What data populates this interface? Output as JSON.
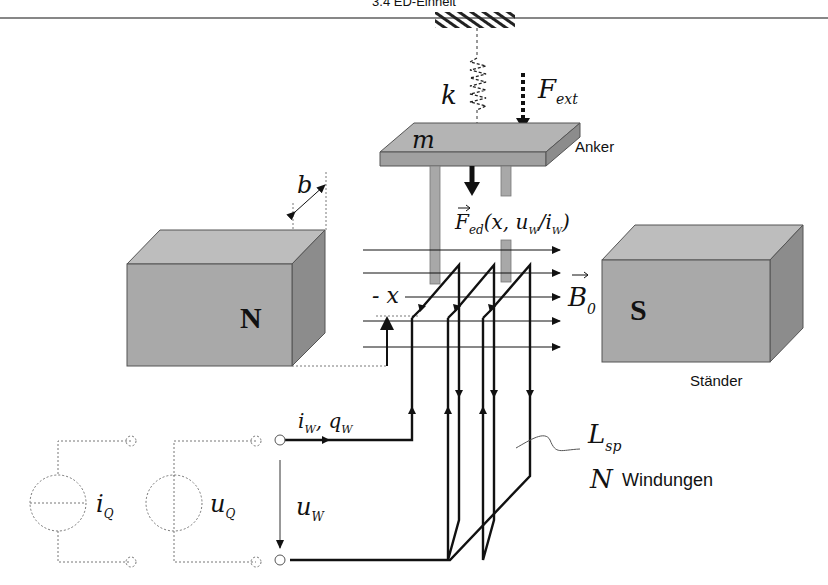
{
  "header": {
    "title": "3.4 ED-Einheit"
  },
  "labels": {
    "spring": "k",
    "external_force": "F",
    "external_force_sub": "ext",
    "mass": "m",
    "armature": "Anker",
    "width": "b",
    "electrodynamic_force": "F",
    "electrodynamic_force_sub": "ed",
    "electrodynamic_force_args": "(x, u",
    "electrodynamic_force_args_sub1": "W",
    "electrodynamic_force_args_mid": "/i",
    "electrodynamic_force_args_sub2": "W",
    "electrodynamic_force_args_end": ")",
    "north_pole": "N",
    "south_pole": "S",
    "position": "x",
    "field": "B",
    "field_sub": "0",
    "stator": "Ständer",
    "coil_current": "i",
    "coil_current_sub": "W",
    "coil_charge": ", q",
    "coil_charge_sub": "W",
    "coil_voltage": "u",
    "coil_voltage_sub": "W",
    "current_source": "i",
    "current_source_sub": "Q",
    "voltage_source": "u",
    "voltage_source_sub": "Q",
    "inductance": "L",
    "inductance_sub": "sp",
    "turns_symbol": "N",
    "turns_label": "Windungen"
  },
  "colors": {
    "magnet_front": "#a9a9a9",
    "magnet_top": "#bdbdbd",
    "magnet_side": "#8c8c8c",
    "armature_top": "#b4b4b4",
    "armature_front": "#a0a0a0",
    "rod": "#a8a8a8",
    "line": "#111111",
    "dashed": "#777777"
  }
}
